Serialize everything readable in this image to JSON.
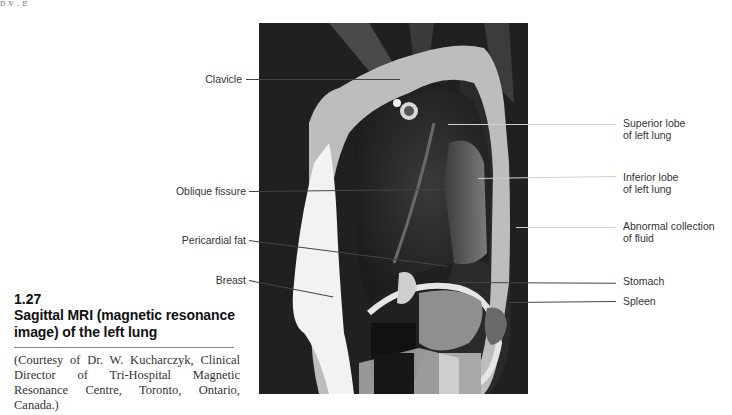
{
  "page": {
    "top_text_fragment": "p                                                          y                                    , g"
  },
  "figure": {
    "number": "1.27",
    "title": "Sagittal MRI (magnetic resonance image) of the left lung",
    "courtesy": "(Courtesy of Dr. W. Kucharczyk, Clinical Director of Tri-Hospital Magnetic Resonance Centre, Toronto, Ontario, Canada.)",
    "image_alt": "Sagittal MRI of the left lung"
  },
  "labels": {
    "left": [
      {
        "id": "clavicle",
        "text": "Clavicle"
      },
      {
        "id": "oblique-fissure",
        "text": "Oblique fissure"
      },
      {
        "id": "pericardial-fat",
        "text": "Pericardial fat"
      },
      {
        "id": "breast",
        "text": "Breast"
      }
    ],
    "right": [
      {
        "id": "superior-lobe",
        "line1": "Superior lobe",
        "line2": "of left lung"
      },
      {
        "id": "inferior-lobe",
        "line1": "Inferior lobe",
        "line2": "of left lung"
      },
      {
        "id": "abnormal-fluid",
        "line1": "Abnormal collection",
        "line2": "of fluid"
      },
      {
        "id": "stomach",
        "line1": "Stomach"
      },
      {
        "id": "spleen",
        "line1": "Spleen"
      }
    ]
  }
}
